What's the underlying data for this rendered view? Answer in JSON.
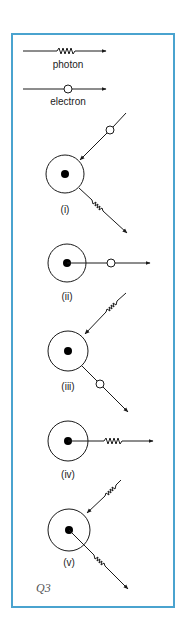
{
  "figure": {
    "frame_color": "#4aa3cf",
    "stroke_color": "#1a1a1a",
    "caption": "Q3"
  },
  "legend": {
    "photon_label": "photon",
    "electron_label": "electron"
  },
  "panels": [
    {
      "id": "i",
      "label": "(i)",
      "incoming": "electron",
      "outgoing": "photon"
    },
    {
      "id": "ii",
      "label": "(ii)",
      "incoming": "none",
      "outgoing": "electron"
    },
    {
      "id": "iii",
      "label": "(iii)",
      "incoming": "photon",
      "outgoing": "electron"
    },
    {
      "id": "iv",
      "label": "(iv)",
      "incoming": "none",
      "outgoing": "photon"
    },
    {
      "id": "v",
      "label": "(v)",
      "incoming": "photon",
      "outgoing": "photon"
    }
  ]
}
